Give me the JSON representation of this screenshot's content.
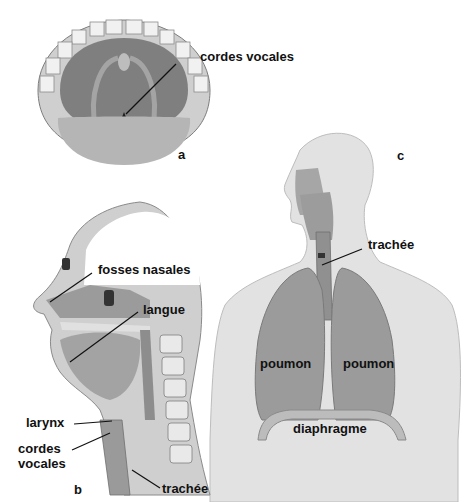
{
  "figure": {
    "top_caption_fragment": "",
    "panels": {
      "a": {
        "letter": "a",
        "title": "oral cavity view",
        "labels": {
          "cordes_vocales": "cordes vocales"
        }
      },
      "b": {
        "letter": "b",
        "labels": {
          "fosses_nasales": "fosses nasales",
          "langue": "langue",
          "larynx": "larynx",
          "cordes_vocales_line1": "cordes",
          "cordes_vocales_line2": "vocales",
          "trachee": "trachée"
        }
      },
      "c": {
        "letter": "c",
        "labels": {
          "trachee": "trachée",
          "poumon_left": "poumon",
          "poumon_right": "poumon",
          "diaphragme": "diaphragme"
        }
      }
    },
    "colors": {
      "background": "#ffffff",
      "tissue_dark": "#8a8a8a",
      "tissue_mid": "#a8a8a8",
      "tissue_light": "#d4d4d4",
      "body_fill": "#e4e4e4",
      "lung": "#9a9a9a",
      "text": "#111111"
    }
  }
}
